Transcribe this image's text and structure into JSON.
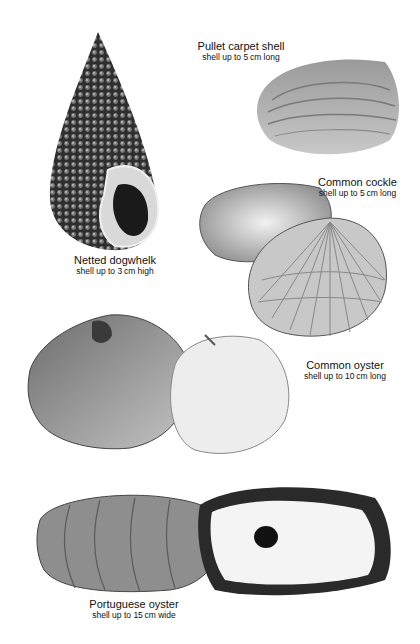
{
  "page": {
    "type": "natural-history illustration plate",
    "background": "#ffffff"
  },
  "specimens": [
    {
      "name": "Pullet carpet shell",
      "size": "shell up to 5 cm long",
      "illustration": "pullet-carpet-shell-illustration"
    },
    {
      "name": "Common cockle",
      "size": "shell up to 5 cm long",
      "illustration": "common-cockle-illustration"
    },
    {
      "name": "Netted dogwhelk",
      "size": "shell up to 3 cm high",
      "illustration": "netted-dogwhelk-illustration"
    },
    {
      "name": "Common oyster",
      "size": "shell up to 10 cm long",
      "illustration": "common-oyster-illustration"
    },
    {
      "name": "Portuguese oyster",
      "size": "shell up to 15 cm wide",
      "illustration": "portuguese-oyster-illustration"
    }
  ]
}
